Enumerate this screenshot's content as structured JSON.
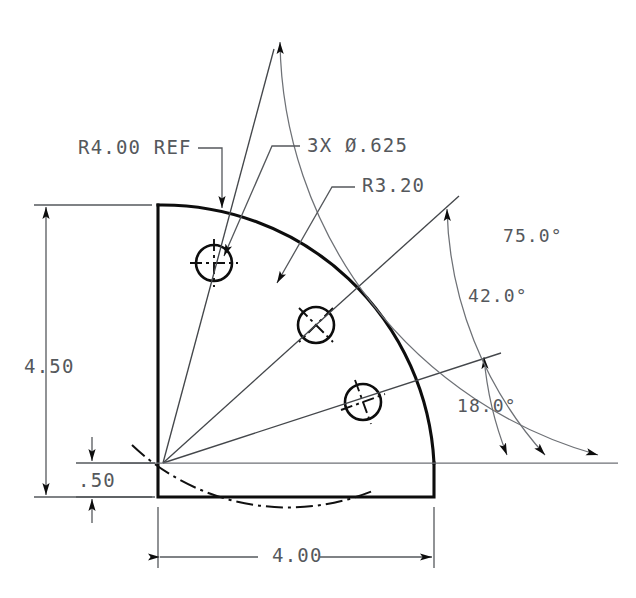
{
  "drawing": {
    "title": "Quarter-round flange bolt-circle drawing",
    "background_color": "#ffffff",
    "line_color": "#0d0d0d",
    "dim_text_color": "#55585c",
    "dimensions": {
      "radius_ref": "R4.00 REF",
      "hole_callout": "3X Ø.625",
      "bolt_circle_radius": "R3.20",
      "height_overall": "4.50",
      "height_base": ".50",
      "width_overall": "4.00",
      "angle_first": "18.0°",
      "angle_second": "42.0°",
      "angle_third": "75.0°"
    },
    "labels": [
      {
        "name": "radius-ref",
        "text": "R4.00 REF",
        "x": 78,
        "y": 154
      },
      {
        "name": "hole-callout",
        "text": "3X Ø.625",
        "x": 307,
        "y": 152
      },
      {
        "name": "bolt-circle-radius",
        "text": "R3.20",
        "x": 362,
        "y": 192
      },
      {
        "name": "height-overall",
        "text": "4.50",
        "x": 24,
        "y": 373
      },
      {
        "name": "height-base",
        "text": ".50",
        "x": 78,
        "y": 487
      },
      {
        "name": "width-overall",
        "text": "4.00",
        "x": 272,
        "y": 562
      },
      {
        "name": "angle-third",
        "text": "75.0°",
        "x": 503,
        "y": 242
      },
      {
        "name": "angle-second",
        "text": "42.0°",
        "x": 468,
        "y": 302
      },
      {
        "name": "angle-first",
        "text": "18.0°",
        "x": 457,
        "y": 412
      }
    ],
    "geometry": {
      "center": {
        "x": 163,
        "y": 463
      },
      "outer_radius": 272,
      "bolt_circle_radius": 226,
      "hole_radius": 18,
      "part_left_x": 158,
      "part_right_x": 434,
      "part_top_y": 205,
      "part_bottom_y": 497,
      "holes": [
        {
          "name": "hole-upper",
          "x": 214,
          "y": 263,
          "angle_deg": 75
        },
        {
          "name": "hole-middle",
          "x": 316,
          "y": 325,
          "angle_deg": 42
        },
        {
          "name": "hole-lower",
          "x": 363,
          "y": 402,
          "angle_deg": 18
        }
      ],
      "angle_arcs": [
        {
          "name": "arc-18",
          "angle_deg": 18,
          "radius": 344,
          "baseline_x": 507
        },
        {
          "name": "arc-42",
          "angle_deg": 42,
          "radius": 382,
          "baseline_x": 545
        },
        {
          "name": "arc-75",
          "angle_deg": 75,
          "radius": 435,
          "baseline_x": 598
        }
      ]
    }
  }
}
